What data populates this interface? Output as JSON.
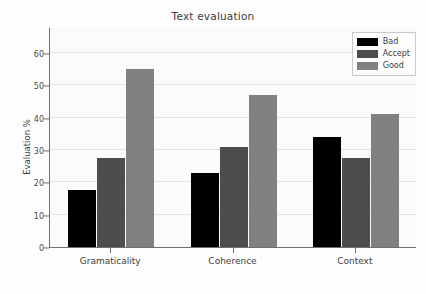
{
  "chart_data": {
    "type": "bar",
    "title": "Text evaluation",
    "xlabel": "",
    "ylabel": "Evaluation %",
    "categories": [
      "Gramaticality",
      "Coherence",
      "Context"
    ],
    "series": [
      {
        "name": "Bad",
        "color": "#000000",
        "values": [
          17.5,
          23.0,
          34.0
        ]
      },
      {
        "name": "Accept",
        "color": "#4d4d4d",
        "values": [
          27.5,
          31.0,
          27.5
        ]
      },
      {
        "name": "Good",
        "color": "#808080",
        "values": [
          55.0,
          47.0,
          41.0
        ]
      }
    ],
    "ylim": [
      0,
      68
    ],
    "yticks": [
      0,
      10,
      20,
      30,
      40,
      50,
      60
    ],
    "ytick_labels": [
      "0",
      "10",
      "20",
      "30",
      "40",
      "50",
      "60"
    ],
    "grid": true,
    "grid_axis": "y",
    "legend_position": "upper right",
    "background_color": "#fbfbfb",
    "grid_color": "#e2e2e8",
    "axis_color": "#6f6f6f"
  }
}
